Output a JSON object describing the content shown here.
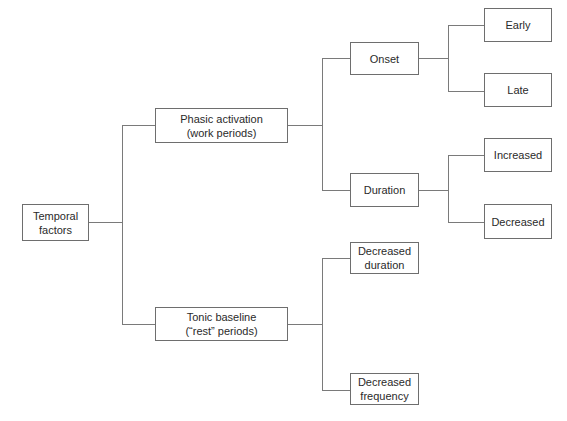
{
  "diagram": {
    "type": "tree",
    "line_color": "#7a7a7a",
    "border_color": "#6e6e6e",
    "nodes": {
      "root": {
        "label": "Temporal\nfactors"
      },
      "phasic": {
        "label": "Phasic activation\n(work periods)"
      },
      "tonic": {
        "label": "Tonic baseline\n(“rest” periods)"
      },
      "onset": {
        "label": "Onset"
      },
      "duration": {
        "label": "Duration"
      },
      "early": {
        "label": "Early"
      },
      "late": {
        "label": "Late"
      },
      "increased": {
        "label": "Increased"
      },
      "decreased": {
        "label": "Decreased"
      },
      "dec_duration": {
        "label": "Decreased\nduration"
      },
      "dec_frequency": {
        "label": "Decreased\nfrequency"
      }
    },
    "edges": [
      [
        "root",
        "phasic"
      ],
      [
        "root",
        "tonic"
      ],
      [
        "phasic",
        "onset"
      ],
      [
        "phasic",
        "duration"
      ],
      [
        "onset",
        "early"
      ],
      [
        "onset",
        "late"
      ],
      [
        "duration",
        "increased"
      ],
      [
        "duration",
        "decreased"
      ],
      [
        "tonic",
        "dec_duration"
      ],
      [
        "tonic",
        "dec_frequency"
      ]
    ]
  }
}
